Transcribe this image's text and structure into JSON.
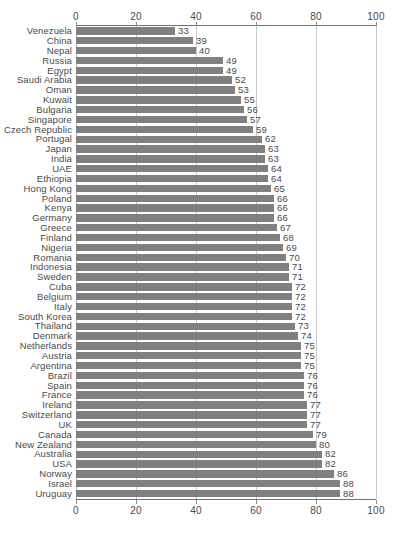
{
  "chart_data": {
    "type": "bar",
    "orientation": "horizontal",
    "title": "",
    "xlabel": "",
    "ylabel": "",
    "xlim": [
      0,
      100
    ],
    "ticks": [
      0,
      20,
      40,
      60,
      80,
      100
    ],
    "grid": true,
    "grid_axis": "x",
    "axis_positions": [
      "top",
      "bottom"
    ],
    "legend": null,
    "bar_color": "#808080",
    "value_labels": true,
    "categories": [
      "Venezuela",
      "China",
      "Nepal",
      "Russia",
      "Egypt",
      "Saudi Arabia",
      "Oman",
      "Kuwait",
      "Bulgaria",
      "Singapore",
      "Czech Republic",
      "Portugal",
      "Japan",
      "India",
      "UAE",
      "Ethiopia",
      "Hong Kong",
      "Poland",
      "Kenya",
      "Germany",
      "Greece",
      "Finland",
      "Nigeria",
      "Romania",
      "Indonesia",
      "Sweden",
      "Cuba",
      "Belgium",
      "Italy",
      "South Korea",
      "Thailand",
      "Denmark",
      "Netherlands",
      "Austria",
      "Argentina",
      "Brazil",
      "Spain",
      "France",
      "Ireland",
      "Switzerland",
      "UK",
      "Canada",
      "New Zealand",
      "Australia",
      "USA",
      "Norway",
      "Israel",
      "Uruguay"
    ],
    "values": [
      33,
      39,
      40,
      49,
      49,
      52,
      53,
      55,
      56,
      57,
      59,
      62,
      63,
      63,
      64,
      64,
      65,
      66,
      66,
      66,
      67,
      68,
      69,
      70,
      71,
      71,
      72,
      72,
      72,
      72,
      73,
      74,
      75,
      75,
      75,
      76,
      76,
      76,
      77,
      77,
      77,
      79,
      80,
      82,
      82,
      86,
      88,
      88
    ]
  }
}
